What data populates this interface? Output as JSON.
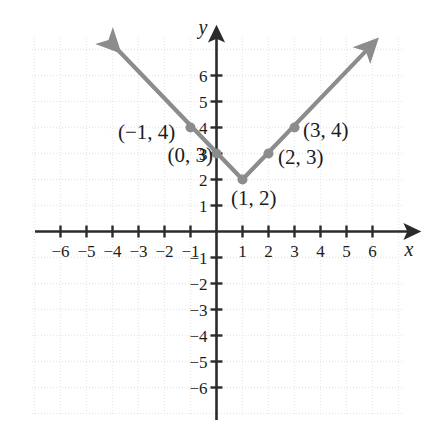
{
  "figure": {
    "title": "",
    "axis_labels": {
      "x": "x",
      "y": "y"
    },
    "colors": {
      "axis": "#2b2b2b",
      "grid": "#e8e8e8",
      "curve": "#8c8c8c",
      "point": "#8c8c8c",
      "text": "#1c1c1c",
      "background": "#ffffff"
    }
  },
  "chart_data": {
    "type": "line",
    "title": "",
    "xlabel": "x",
    "ylabel": "y",
    "xlim": [
      -7,
      7
    ],
    "ylim": [
      -7,
      7
    ],
    "grid": true,
    "legend": "none",
    "equation_shape": "absolute-value V",
    "vertex": {
      "x": 1,
      "y": 2
    },
    "series": [
      {
        "name": "y = |x - 1| + 2",
        "x": [
          -4,
          1,
          5.9
        ],
        "y": [
          7.2,
          2,
          7.1
        ],
        "arrow_start": true,
        "arrow_end": true
      }
    ],
    "points": [
      {
        "x": -1,
        "y": 4,
        "label": "(−1, 4)",
        "label_pos": "left"
      },
      {
        "x": 0,
        "y": 3,
        "label": "(0, 3)",
        "label_pos": "left"
      },
      {
        "x": 1,
        "y": 2,
        "label": "(1, 2)",
        "label_pos": "below-right"
      },
      {
        "x": 2,
        "y": 3,
        "label": "(2, 3)",
        "label_pos": "right"
      },
      {
        "x": 3,
        "y": 4,
        "label": "(3, 4)",
        "label_pos": "right"
      }
    ],
    "x_ticks": [
      {
        "value": -6,
        "label": "−6"
      },
      {
        "value": -5,
        "label": "−5"
      },
      {
        "value": -4,
        "label": "−4"
      },
      {
        "value": -3,
        "label": "−3"
      },
      {
        "value": -2,
        "label": "−2"
      },
      {
        "value": -1,
        "label": "−1"
      },
      {
        "value": 1,
        "label": "1"
      },
      {
        "value": 2,
        "label": "2"
      },
      {
        "value": 3,
        "label": "3"
      },
      {
        "value": 4,
        "label": "4"
      },
      {
        "value": 5,
        "label": "5"
      },
      {
        "value": 6,
        "label": "6"
      }
    ],
    "y_ticks": [
      {
        "value": 6,
        "label": "6"
      },
      {
        "value": 5,
        "label": "5"
      },
      {
        "value": 4,
        "label": "4"
      },
      {
        "value": 3,
        "label": "3"
      },
      {
        "value": 2,
        "label": "2"
      },
      {
        "value": 1,
        "label": "1"
      },
      {
        "value": -1,
        "label": "−1"
      },
      {
        "value": -2,
        "label": "−2"
      },
      {
        "value": -3,
        "label": "−3"
      },
      {
        "value": -4,
        "label": "−4"
      },
      {
        "value": -5,
        "label": "−5"
      },
      {
        "value": -6,
        "label": "−6"
      }
    ]
  }
}
